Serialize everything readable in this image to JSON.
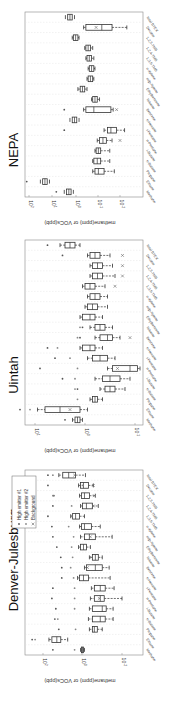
{
  "figure": {
    "rotation_deg": -90,
    "ylabel": "methane(ppm) or VOCs(ppb)",
    "legend": [
      {
        "label": "High emitter #1",
        "marker": "dot",
        "color": "#555555"
      },
      {
        "label": "High emitter #2",
        "marker": "dot",
        "color": "#888888"
      },
      {
        "label": "Background",
        "marker": "x",
        "color": "#666666"
      }
    ]
  },
  "chart_data": [
    {
      "type": "box",
      "title": "NEPA",
      "xlabel": "",
      "ylabel": "methane(ppm) or VOCs(ppb)",
      "yscale": "log",
      "ylim_log10": [
        -2.4,
        2.2
      ],
      "yticks": [
        "10^2",
        "10^1",
        "10^0",
        "10^-1",
        "10^-2"
      ],
      "ytick_log10": [
        2,
        1,
        0,
        -1,
        -2
      ],
      "categories": [
        "Methane",
        "Ethane",
        "Propane",
        "n-Butane",
        "i-Butane",
        "n-Pentane",
        "i-Pentane",
        "n-Hexane",
        "Benzene",
        "Toluene",
        "Ethylbenzene",
        "m/p-Xylene",
        "o-Xylene",
        "1,3,5-TMB",
        "1,2,4-TMB",
        "1,2,3-TMB",
        "Decane",
        "Total BTEX"
      ],
      "median_log10": [
        0.25,
        1.3,
        -1.05,
        -1.0,
        -1.05,
        -1.25,
        -1.6,
        0.0,
        -0.85,
        -0.9,
        -0.35,
        -0.7,
        -0.75,
        -0.65,
        -0.6,
        -0.05,
        -1.2,
        0.2
      ],
      "q1_log10": [
        0.15,
        1.2,
        -0.9,
        -0.85,
        -0.95,
        -1.1,
        -1.45,
        -0.1,
        -0.5,
        -0.8,
        -0.25,
        -0.6,
        -0.65,
        -0.55,
        -0.5,
        0.05,
        -0.5,
        0.1
      ],
      "q3_log10": [
        0.35,
        1.4,
        -1.3,
        -1.15,
        -1.15,
        -1.4,
        -1.85,
        0.1,
        -1.6,
        -1.0,
        -0.45,
        -0.8,
        -0.85,
        -0.75,
        -0.7,
        -0.15,
        -1.65,
        0.3
      ],
      "whisker_lo_log10": [
        0.05,
        1.1,
        -0.8,
        -0.8,
        -0.9,
        -1.0,
        -1.3,
        -0.2,
        -0.4,
        -0.75,
        -0.15,
        -0.55,
        -0.6,
        -0.5,
        -0.45,
        0.1,
        -0.4,
        0.0
      ],
      "whisker_hi_log10": [
        0.45,
        1.5,
        -1.75,
        -1.55,
        -1.55,
        -1.65,
        -2.2,
        0.2,
        -1.7,
        -1.1,
        -0.55,
        -0.85,
        -0.9,
        -0.85,
        -0.8,
        -0.2,
        -2.3,
        0.4
      ],
      "high_emitter_1_log10": [
        0.8,
        2.1,
        null,
        null,
        null,
        null,
        0.45,
        null,
        0.45,
        null,
        null,
        null,
        null,
        null,
        null,
        null,
        null,
        null
      ],
      "high_emitter_2_log10": [
        null,
        null,
        null,
        null,
        null,
        null,
        null,
        null,
        null,
        null,
        null,
        null,
        null,
        null,
        null,
        null,
        null,
        null
      ],
      "background_log10": [
        null,
        null,
        null,
        null,
        null,
        -2.0,
        null,
        null,
        -1.85,
        null,
        null,
        null,
        null,
        null,
        null,
        null,
        -0.95,
        null
      ]
    },
    {
      "type": "box",
      "title": "Uintah",
      "xlabel": "",
      "ylabel": "methane(ppm) or VOCs(ppb)",
      "yscale": "log",
      "ylim_log10": [
        -1.2,
        1.2
      ],
      "yticks": [
        "10^1",
        "10^0",
        "10^-1"
      ],
      "ytick_log10": [
        1,
        0,
        -1
      ],
      "categories": [
        "Methane",
        "Ethane",
        "Propane",
        "n-Butane",
        "i-Butane",
        "n-Pentane",
        "i-Pentane",
        "n-Hexane",
        "Benzene",
        "Toluene",
        "Ethylbenzene",
        "m/p-Xylene",
        "o-Xylene",
        "1,3,5-TMB",
        "1,2,4-TMB",
        "1,2,3-TMB",
        "Decane",
        "Total BTEX"
      ],
      "median_log10": [
        0.15,
        0.5,
        -0.2,
        -0.5,
        -0.5,
        -0.9,
        -0.3,
        -0.1,
        -0.45,
        -0.3,
        -0.1,
        -0.15,
        -0.2,
        -0.1,
        -0.25,
        -0.25,
        -0.2,
        0.3
      ],
      "q1_log10": [
        0.2,
        0.8,
        -0.15,
        -0.4,
        -0.35,
        -0.55,
        -0.15,
        0.05,
        -0.3,
        -0.2,
        0.05,
        -0.05,
        -0.1,
        0.0,
        -0.15,
        -0.15,
        -0.1,
        0.4
      ],
      "q3_log10": [
        0.1,
        0.1,
        -0.25,
        -0.6,
        -0.7,
        -1.05,
        -0.45,
        -0.2,
        -0.55,
        -0.4,
        -0.2,
        -0.25,
        -0.3,
        -0.2,
        -0.35,
        -0.35,
        -0.3,
        0.2
      ],
      "whisker_lo_log10": [
        0.25,
        0.95,
        -0.1,
        -0.3,
        -0.2,
        -0.45,
        -0.05,
        0.1,
        -0.2,
        -0.1,
        0.1,
        0.0,
        -0.05,
        0.05,
        -0.1,
        -0.1,
        -0.05,
        0.5
      ],
      "whisker_hi_log10": [
        0.05,
        -0.05,
        -0.35,
        -0.8,
        -0.9,
        -1.1,
        -0.6,
        -0.35,
        -0.7,
        -0.55,
        -0.35,
        -0.45,
        -0.45,
        -0.4,
        -0.6,
        -0.55,
        -0.5,
        0.1
      ],
      "high_emitter_1_log10": [
        0.4,
        1.3,
        null,
        0.15,
        0.45,
        0.9,
        0.6,
        0.75,
        0.1,
        0.05,
        null,
        null,
        null,
        null,
        null,
        null,
        0.45,
        0.75
      ],
      "high_emitter_2_log10": [
        null,
        1.1,
        0.15,
        0.2,
        0.2,
        0.15,
        0.3,
        0.55,
        0.15,
        0.1,
        null,
        null,
        null,
        null,
        null,
        null,
        null,
        null
      ],
      "background_log10": [
        null,
        0.3,
        null,
        null,
        null,
        -0.65,
        null,
        null,
        -0.9,
        null,
        null,
        null,
        null,
        -0.6,
        -0.75,
        -0.75,
        -0.75,
        null
      ]
    },
    {
      "type": "box",
      "title": "Denver-Julesburg",
      "xlabel": "",
      "ylabel": "methane(ppm) or VOCs(ppb)",
      "yscale": "log",
      "ylim_log10": [
        -2.6,
        2.3
      ],
      "yticks": [
        "10^2",
        "10^0",
        "10^-2"
      ],
      "ytick_log10": [
        2,
        0,
        -2
      ],
      "categories": [
        "Methane",
        "Ethane",
        "Propane",
        "n-Butane",
        "i-Butane",
        "n-Pentane",
        "i-Pentane",
        "n-Hexane",
        "Benzene",
        "Toluene",
        "Ethylbenzene",
        "m/p-Xylene",
        "o-Xylene",
        "1,3,5-TMB",
        "1,2,4-TMB",
        "1,2,3-TMB",
        "Decane",
        "Total BTEX"
      ],
      "median_log10": [
        0.0,
        1.3,
        -0.6,
        -0.9,
        -1.0,
        -0.9,
        -0.9,
        -0.05,
        -0.65,
        -0.65,
        -0.05,
        -0.35,
        -0.1,
        0.35,
        -0.2,
        -0.1,
        -0.05,
        0.7
      ],
      "q1_log10": [
        0.05,
        1.55,
        -0.5,
        -0.5,
        -0.5,
        -0.6,
        -0.6,
        0.15,
        -0.2,
        -0.5,
        0.1,
        -0.1,
        0.05,
        0.5,
        0.0,
        0.05,
        0.1,
        1.0
      ],
      "q3_log10": [
        -0.05,
        1.1,
        -0.75,
        -1.15,
        -1.2,
        -1.1,
        -1.15,
        -0.3,
        -1.0,
        -0.8,
        -0.2,
        -0.65,
        -0.45,
        0.15,
        -0.5,
        -0.35,
        -0.3,
        0.35
      ],
      "whisker_lo_log10": [
        0.1,
        1.7,
        -0.35,
        -0.3,
        -0.35,
        -0.4,
        -0.45,
        0.25,
        -0.1,
        -0.35,
        0.2,
        0.1,
        0.15,
        0.6,
        0.1,
        0.15,
        0.2,
        1.2
      ],
      "whisker_hi_log10": [
        -0.1,
        0.75,
        -1.0,
        -1.55,
        -1.55,
        -2.0,
        -1.6,
        -1.4,
        -1.35,
        -1.0,
        -0.4,
        -1.5,
        -0.9,
        -0.1,
        -0.8,
        -0.65,
        -0.55,
        -0.15
      ],
      "high_emitter_1_log10": [
        1.5,
        2.55,
        1.2,
        1.4,
        1.35,
        1.55,
        1.5,
        1.05,
        1.05,
        1.1,
        1.3,
        1.5,
        1.55,
        1.75,
        1.5,
        1.45,
        1.75,
        1.75
      ],
      "high_emitter_2_log10": [
        0.4,
        2.4,
        0.35,
        1.25,
        0.4,
        0.4,
        0.4,
        0.45,
        0.6,
        0.5,
        0.55,
        0.45,
        0.7,
        0.55,
        0.55,
        1.5,
        0.0,
        1.5
      ],
      "background_log10": [
        null,
        null,
        null,
        null,
        null,
        -0.85,
        null,
        null,
        -0.25,
        -0.45,
        null,
        -0.4,
        null,
        null,
        -0.55,
        -0.6,
        -0.55,
        0.4
      ]
    }
  ]
}
